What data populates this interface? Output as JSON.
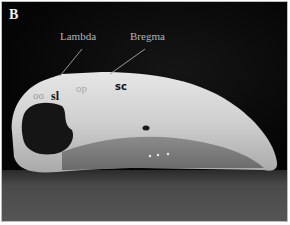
{
  "figure": {
    "panel_label": "B",
    "annotations": {
      "lambda": "Lambda",
      "bregma": "Bregma",
      "op": "op",
      "sc": "sc",
      "oo": "oo",
      "sl": "sl"
    },
    "colors": {
      "background": "#0b0b0b",
      "bone": "#d8d8d8",
      "surface": "#4a4a4a",
      "label_light": "#b5b5b5",
      "label_dark": "#111111"
    }
  }
}
